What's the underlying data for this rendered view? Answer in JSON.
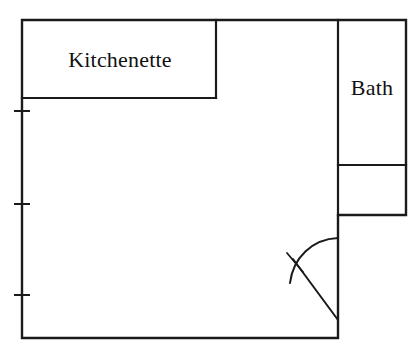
{
  "plan": {
    "title": "Apartment Floor Plan",
    "canvas": {
      "width": 419,
      "height": 359
    },
    "stroke_color": "#1a1a1a",
    "background_color": "#ffffff",
    "rooms": [
      {
        "id": "kitchenette",
        "label": "Kitchenette",
        "label_x": 120,
        "label_y": 60,
        "bounds": {
          "x1": 22,
          "y1": 20,
          "x2": 216,
          "y2": 98
        }
      },
      {
        "id": "bath",
        "label": "Bath",
        "label_x": 372,
        "label_y": 88,
        "bounds": {
          "x1": 338,
          "y1": 20,
          "x2": 406,
          "y2": 165
        }
      },
      {
        "id": "closet",
        "label": "",
        "label_x": 372,
        "label_y": 190,
        "bounds": {
          "x1": 338,
          "y1": 165,
          "x2": 406,
          "y2": 215
        }
      },
      {
        "id": "main-room",
        "label": "",
        "label_x": 180,
        "label_y": 220,
        "bounds": {
          "x1": 22,
          "y1": 20,
          "x2": 338,
          "y2": 338
        }
      }
    ],
    "outer_wall_path": "M 22 338 L 22 20 L 406 20 L 406 215 L 338 215 L 338 338 L 22 338",
    "partitions": [
      {
        "id": "kitchenette-right-wall",
        "path": "M 216 20 L 216 98"
      },
      {
        "id": "kitchenette-bottom-wall",
        "path": "M 22 98 L 216 98"
      },
      {
        "id": "bath-left-wall",
        "path": "M 338 20 L 338 215"
      },
      {
        "id": "bath-bottom-wall",
        "path": "M 338 165 L 406 165"
      }
    ],
    "window_ticks": [
      {
        "id": "window-tick-upper",
        "x": 22,
        "y": 111,
        "half_width": 8
      },
      {
        "id": "window-tick-middle",
        "x": 22,
        "y": 204,
        "half_width": 8
      },
      {
        "id": "window-tick-lower",
        "x": 22,
        "y": 295,
        "half_width": 8
      }
    ],
    "door": {
      "id": "entry-door",
      "hinge_x": 338,
      "hinge_y": 238,
      "leaf_end_x": 338,
      "leaf_end_y": 320,
      "arc_path": "M 338 238 C 312 239 293 258 290 283",
      "leaf_path": "M 293 259 L 338 320",
      "mark_path": "M 287 253 L 303 272"
    }
  }
}
